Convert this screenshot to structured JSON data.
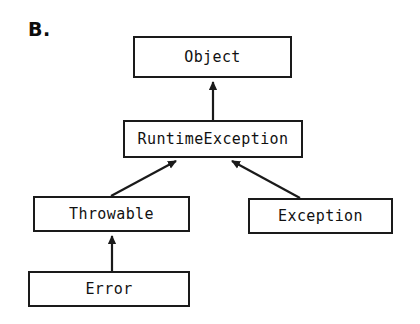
{
  "figure": {
    "panel_label": "B.",
    "type": "class-hierarchy-diagram",
    "background_color": "#ffffff",
    "line_color": "#1a1a1a",
    "text_color": "#111111"
  },
  "nodes": [
    {
      "id": "object",
      "label": "Object",
      "x": 133,
      "y": 36,
      "width": 159,
      "height": 42
    },
    {
      "id": "runtimeexception",
      "label": "RuntimeException",
      "x": 123,
      "y": 120,
      "width": 180,
      "height": 38
    },
    {
      "id": "throwable",
      "label": "Throwable",
      "x": 33,
      "y": 196,
      "width": 157,
      "height": 36
    },
    {
      "id": "exception",
      "label": "Exception",
      "x": 248,
      "y": 198,
      "width": 145,
      "height": 36
    },
    {
      "id": "error",
      "label": "Error",
      "x": 28,
      "y": 271,
      "width": 162,
      "height": 36
    }
  ],
  "edges": [
    {
      "id": "runtimeexception-to-object",
      "from": "runtimeexception",
      "to": "object",
      "arrow": "open-triangle",
      "x1": 213,
      "y1": 120,
      "x2": 213,
      "y2": 80
    },
    {
      "id": "throwable-to-runtimeexception",
      "from": "throwable",
      "to": "runtimeexception",
      "arrow": "open-triangle",
      "x1": 111,
      "y1": 196,
      "x2": 178,
      "y2": 160
    },
    {
      "id": "exception-to-runtimeexception",
      "from": "exception",
      "to": "runtimeexception",
      "arrow": "open-triangle",
      "x1": 300,
      "y1": 198,
      "x2": 231,
      "y2": 160
    },
    {
      "id": "error-to-throwable",
      "from": "error",
      "to": "throwable",
      "arrow": "open-triangle",
      "x1": 112,
      "y1": 271,
      "x2": 112,
      "y2": 234
    }
  ]
}
